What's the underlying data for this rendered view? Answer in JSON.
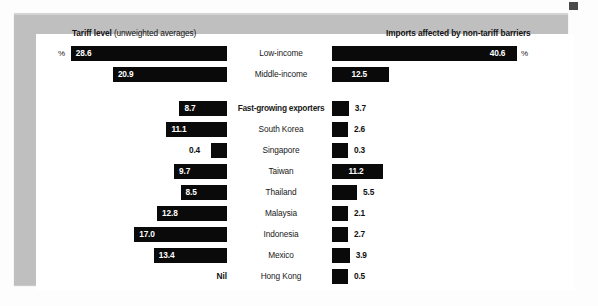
{
  "figure": {
    "headers": {
      "left_bold": "Tariff level",
      "left_light": " (unweighted averages)",
      "right": "Imports affected by non-tariff barriers"
    },
    "percent_symbol_left": "%",
    "percent_symbol_right": "%",
    "nil_label": "Nil"
  },
  "chart_data": {
    "type": "bar",
    "orientation": "horizontal-bidirectional",
    "grid": false,
    "legend": false,
    "xlabel": "",
    "ylabel": "",
    "series": [
      {
        "name": "Tariff level (unweighted averages)",
        "side": "left",
        "unit": "%",
        "values": [
          28.6,
          20.9,
          8.7,
          11.1,
          0.4,
          9.7,
          8.5,
          12.8,
          17.0,
          null
        ],
        "labels": [
          "28.6",
          "20.9",
          "8.7",
          "11.1",
          "0.4",
          "9.7",
          "8.5",
          "12.8",
          "17.0",
          "Nil"
        ]
      },
      {
        "name": "Imports affected by non-tariff barriers",
        "side": "right",
        "unit": "%",
        "values": [
          40.6,
          12.5,
          3.7,
          2.6,
          0.3,
          11.2,
          5.5,
          2.1,
          2.7,
          3.9,
          0.5
        ],
        "labels": [
          "40.6",
          "12.5",
          "3.7",
          "2.6",
          "0.3",
          "11.2",
          "5.5",
          "2.1",
          "2.7",
          "3.9",
          "0.5"
        ]
      }
    ],
    "groups": [
      {
        "name": "income",
        "rows": [
          {
            "category": "Low-income",
            "bold": false,
            "left": 28.6,
            "left_label": "28.6",
            "right": 40.6,
            "right_label": "40.6"
          },
          {
            "category": "Middle-income",
            "bold": false,
            "left": 20.9,
            "left_label": "20.9",
            "right": 12.5,
            "right_label": "12.5"
          }
        ]
      },
      {
        "name": "exporters",
        "rows": [
          {
            "category": "Fast-growing exporters",
            "bold": true,
            "left": 8.7,
            "left_label": "8.7",
            "right": 3.7,
            "right_label": "3.7"
          },
          {
            "category": "South Korea",
            "bold": false,
            "left": 11.1,
            "left_label": "11.1",
            "right": 2.6,
            "right_label": "2.6"
          },
          {
            "category": "Singapore",
            "bold": false,
            "left": 0.4,
            "left_label": "0.4",
            "right": 0.3,
            "right_label": "0.3"
          },
          {
            "category": "Taiwan",
            "bold": false,
            "left": 9.7,
            "left_label": "9.7",
            "right": 11.2,
            "right_label": "11.2"
          },
          {
            "category": "Thailand",
            "bold": false,
            "left": 8.5,
            "left_label": "8.5",
            "right": 5.5,
            "right_label": "5.5"
          },
          {
            "category": "Malaysia",
            "bold": false,
            "left": 12.8,
            "left_label": "12.8",
            "right": 2.1,
            "right_label": "2.1"
          },
          {
            "category": "Indonesia",
            "bold": false,
            "left": 17.0,
            "left_label": "17.0",
            "right": 2.7,
            "right_label": "2.7"
          },
          {
            "category": "Mexico",
            "bold": false,
            "left": 13.4,
            "left_label": "13.4",
            "right": 3.9,
            "right_label": "3.9"
          },
          {
            "category": "Hong Kong",
            "bold": false,
            "left": null,
            "left_label": "Nil",
            "right": 0.5,
            "right_label": "0.5"
          }
        ]
      }
    ]
  },
  "colors": {
    "bar": "#0a0a0a",
    "frame": "#bfbfbf",
    "page": "#ffffff",
    "value_inside": "#ffffff",
    "value_outside": "#101010"
  }
}
